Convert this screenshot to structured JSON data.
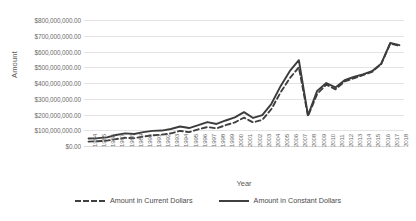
{
  "chart_data": {
    "type": "line",
    "title": "",
    "xlabel": "Year",
    "ylabel": "Amount",
    "ylim": [
      0,
      800000000
    ],
    "ytick_step": 100000000,
    "grid": true,
    "legend_position": "bottom",
    "ytick_labels": [
      "$800,000,000.00",
      "$700,000,000.00",
      "$600,000,000.00",
      "$500,000,000.00",
      "$400,000,000.00",
      "$300,000,000.00",
      "$200,000,000.00",
      "$100,000,000.00",
      "$0.00"
    ],
    "ytick_values": [
      800000000,
      700000000,
      600000000,
      500000000,
      400000000,
      300000000,
      200000000,
      100000000,
      0
    ],
    "categories": [
      "1984",
      "1985",
      "1986",
      "1987",
      "1988",
      "1989",
      "1990",
      "1991",
      "1992",
      "1993",
      "1994",
      "1995",
      "1996",
      "1997",
      "1998",
      "1999",
      "2000",
      "2001",
      "2002",
      "2003",
      "2004",
      "2005",
      "2006",
      "2007",
      "2008",
      "2009",
      "2010",
      "2011",
      "2012",
      "2013",
      "2014",
      "2015",
      "2016",
      "2017",
      "2018"
    ],
    "series": [
      {
        "name": "Amount in Current Dollars",
        "style": "dashed",
        "color": "#404040",
        "values": [
          28000000,
          30000000,
          34000000,
          44000000,
          52000000,
          50000000,
          60000000,
          68000000,
          72000000,
          80000000,
          96000000,
          88000000,
          106000000,
          120000000,
          112000000,
          132000000,
          150000000,
          180000000,
          150000000,
          166000000,
          235000000,
          340000000,
          430000000,
          500000000,
          190000000,
          330000000,
          390000000,
          360000000,
          410000000,
          430000000,
          450000000,
          470000000,
          520000000,
          650000000,
          635000000
        ]
      },
      {
        "name": "Amount in Constant Dollars",
        "style": "solid",
        "color": "#3c3c3c",
        "values": [
          48000000,
          50000000,
          55000000,
          70000000,
          80000000,
          76000000,
          88000000,
          96000000,
          98000000,
          108000000,
          124000000,
          114000000,
          132000000,
          152000000,
          140000000,
          162000000,
          182000000,
          215000000,
          178000000,
          196000000,
          268000000,
          380000000,
          475000000,
          545000000,
          195000000,
          350000000,
          400000000,
          372000000,
          418000000,
          438000000,
          455000000,
          475000000,
          522000000,
          655000000,
          640000000
        ]
      }
    ]
  },
  "legend": {
    "items": [
      {
        "label": "Amount in Current Dollars",
        "style": "dashed"
      },
      {
        "label": "Amount in Constant Dollars",
        "style": "solid"
      }
    ]
  }
}
